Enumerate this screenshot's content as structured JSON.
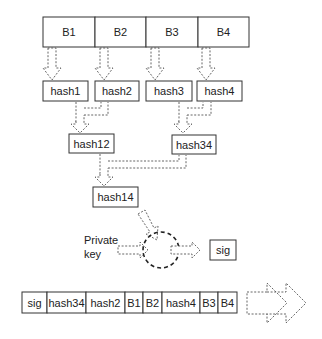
{
  "diagram": {
    "blocks": [
      "B1",
      "B2",
      "B3",
      "B4"
    ],
    "leaf_hashes": [
      "hash1",
      "hash2",
      "hash3",
      "hash4"
    ],
    "mid_hashes": [
      "hash12",
      "hash34"
    ],
    "root_hash": "hash14",
    "private_key_label_line1": "Private",
    "private_key_label_line2": "key",
    "signature": "sig",
    "packet": [
      "sig",
      "hash34",
      "hash2",
      "B1",
      "B2",
      "hash4",
      "B3",
      "B4"
    ],
    "colors": {
      "stroke": "#333333",
      "dashed": "#555555",
      "background": "#ffffff"
    }
  }
}
